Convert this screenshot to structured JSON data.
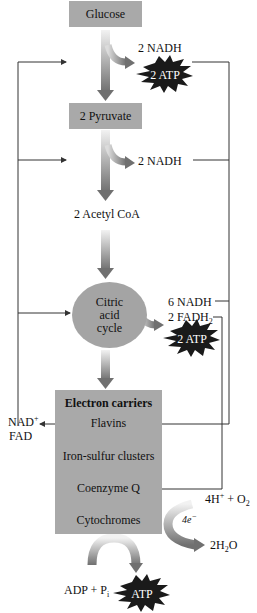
{
  "diagram": {
    "nodes": {
      "glucose": "Glucose",
      "pyruvate": "2 Pyruvate",
      "acetyl_coa": "2 Acetyl CoA",
      "citric_acid_cycle": [
        "Citric",
        "acid",
        "cycle"
      ]
    },
    "outputs": {
      "glycolysis_nadh": "2 NADH",
      "glycolysis_atp": "2 ATP",
      "pyruvate_nadh": "2 NADH",
      "cycle_nadh": "6 NADH",
      "cycle_fadh2": "2 FADH",
      "cycle_fadh2_sub": "2",
      "cycle_atp": "2 ATP"
    },
    "electron_carriers": {
      "title": "Electron carriers",
      "items": [
        "Flavins",
        "Iron-sulfur clusters",
        "Coenzyme Q",
        "Cytochromes"
      ]
    },
    "side_labels": {
      "nad": "NAD",
      "nad_sup": "+",
      "fad": "FAD"
    },
    "oxygen": {
      "reactants": "4H",
      "reactants_sup": "+",
      "plus_o2": " + O",
      "o2_sub": "2",
      "electrons": "4e",
      "electrons_sup": "−",
      "product_pre": "2H",
      "product_sub": "2",
      "product_post": "O"
    },
    "phosphorylation": {
      "reactants": "ADP + P",
      "reactants_sub": "i",
      "product": "ATP"
    },
    "colors": {
      "box_gray": "#a9a9a9",
      "circle_gray": "#a4a4a4",
      "arrow_gray": "#808080",
      "star_black": "#1a1a1a",
      "line": "#333333"
    }
  }
}
